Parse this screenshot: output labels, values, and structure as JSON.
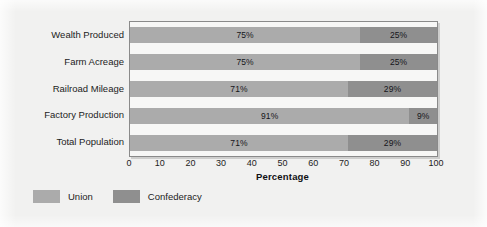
{
  "chart_data": {
    "type": "bar",
    "orientation": "horizontal",
    "stacked": true,
    "title": "",
    "xlabel": "Percentage",
    "ylabel": "",
    "xlim": [
      0,
      100
    ],
    "xticks": [
      0,
      10,
      20,
      30,
      40,
      50,
      60,
      70,
      80,
      90,
      100
    ],
    "xtick_labels": [
      "0",
      "10",
      "20",
      "30",
      "40",
      "50",
      "60",
      "70",
      "80",
      "90",
      "100"
    ],
    "grid": false,
    "legend_position": "below-left",
    "categories": [
      "Wealth Produced",
      "Farm Acreage",
      "Railroad Mileage",
      "Factory Production",
      "Total Population"
    ],
    "series": [
      {
        "name": "Union",
        "color": "#ababab",
        "values": [
          75,
          75,
          71,
          91,
          71
        ],
        "labels": [
          "75%",
          "75%",
          "71%",
          "91%",
          "71%"
        ]
      },
      {
        "name": "Confederacy",
        "color": "#8f8f8f",
        "values": [
          25,
          25,
          29,
          9,
          29
        ],
        "labels": [
          "25%",
          "25%",
          "29%",
          "9%",
          "29%"
        ]
      }
    ]
  },
  "legend": {
    "items": [
      {
        "label": "Union",
        "color": "#ababab"
      },
      {
        "label": "Confederacy",
        "color": "#8f8f8f"
      }
    ]
  },
  "colors": {
    "union": "#ababab",
    "confederacy": "#8f8f8f",
    "page_background": "#f1f1f0",
    "plot_background": "#f7f7f6",
    "plot_border": "#8a8a8a",
    "text": "#1c1c1c"
  }
}
